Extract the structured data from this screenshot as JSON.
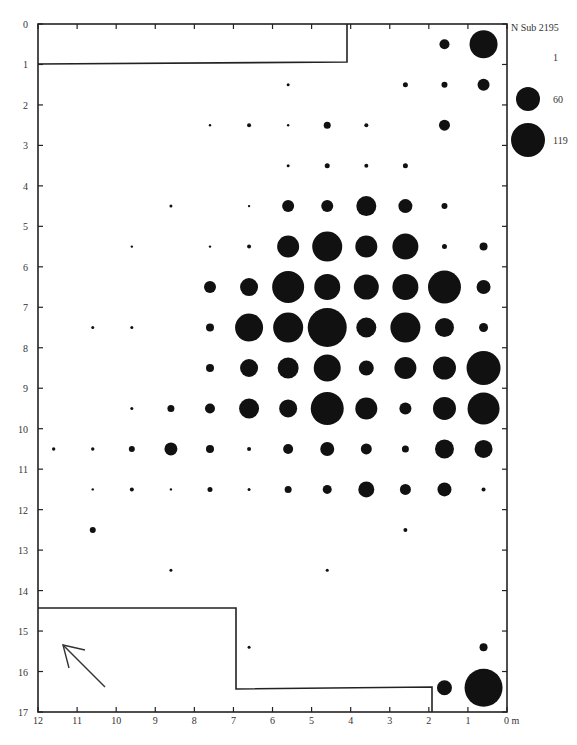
{
  "chart_data": {
    "type": "scatter",
    "subtype": "proportional-symbol grid map",
    "title": "",
    "xlabel": "m",
    "ylabel": "",
    "xlim": [
      12,
      0
    ],
    "ylim": [
      17,
      0
    ],
    "x_ticks": [
      "12",
      "11",
      "10",
      "9",
      "8",
      "7",
      "6",
      "5",
      "4",
      "3",
      "2",
      "1",
      "0 m"
    ],
    "y_ticks": [
      "0",
      "1",
      "2",
      "3",
      "4",
      "5",
      "6",
      "7",
      "8",
      "9",
      "10",
      "11",
      "12",
      "13",
      "14",
      "15",
      "16",
      "17"
    ],
    "grid": false,
    "legend": {
      "position": "top-right",
      "title": "N Sub",
      "total": "2195",
      "entries": [
        {
          "label": "1",
          "radius_px": 0
        },
        {
          "label": "60",
          "radius_px": 12
        },
        {
          "label": "119",
          "radius_px": 17
        }
      ]
    },
    "points_note": "x,y in metres; r = symbol radius in px (area proportional to count)",
    "points": [
      {
        "x": 1.6,
        "y": 0.5,
        "r": 5
      },
      {
        "x": 0.6,
        "y": 0.5,
        "r": 14
      },
      {
        "x": 5.6,
        "y": 1.5,
        "r": 1.5
      },
      {
        "x": 2.6,
        "y": 1.5,
        "r": 2.5
      },
      {
        "x": 1.6,
        "y": 1.5,
        "r": 3
      },
      {
        "x": 0.6,
        "y": 1.5,
        "r": 6
      },
      {
        "x": 7.6,
        "y": 2.5,
        "r": 1.2
      },
      {
        "x": 6.6,
        "y": 2.5,
        "r": 2
      },
      {
        "x": 5.6,
        "y": 2.5,
        "r": 1.2
      },
      {
        "x": 4.6,
        "y": 2.5,
        "r": 3.5
      },
      {
        "x": 3.6,
        "y": 2.5,
        "r": 2
      },
      {
        "x": 1.6,
        "y": 2.5,
        "r": 5.5
      },
      {
        "x": 5.6,
        "y": 3.5,
        "r": 1.5
      },
      {
        "x": 4.6,
        "y": 3.5,
        "r": 2.5
      },
      {
        "x": 3.6,
        "y": 3.5,
        "r": 2
      },
      {
        "x": 2.6,
        "y": 3.5,
        "r": 2.5
      },
      {
        "x": 8.6,
        "y": 4.5,
        "r": 1.5
      },
      {
        "x": 6.6,
        "y": 4.5,
        "r": 1.2
      },
      {
        "x": 5.6,
        "y": 4.5,
        "r": 6
      },
      {
        "x": 4.6,
        "y": 4.5,
        "r": 6
      },
      {
        "x": 3.6,
        "y": 4.5,
        "r": 10
      },
      {
        "x": 2.6,
        "y": 4.5,
        "r": 7
      },
      {
        "x": 1.6,
        "y": 4.5,
        "r": 3
      },
      {
        "x": 9.6,
        "y": 5.5,
        "r": 1.2
      },
      {
        "x": 7.6,
        "y": 5.5,
        "r": 1.2
      },
      {
        "x": 6.6,
        "y": 5.5,
        "r": 2
      },
      {
        "x": 5.6,
        "y": 5.5,
        "r": 11
      },
      {
        "x": 4.6,
        "y": 5.5,
        "r": 15
      },
      {
        "x": 3.6,
        "y": 5.5,
        "r": 11
      },
      {
        "x": 2.6,
        "y": 5.5,
        "r": 13
      },
      {
        "x": 1.6,
        "y": 5.5,
        "r": 2.5
      },
      {
        "x": 0.6,
        "y": 5.5,
        "r": 4
      },
      {
        "x": 7.6,
        "y": 6.5,
        "r": 6
      },
      {
        "x": 6.6,
        "y": 6.5,
        "r": 9
      },
      {
        "x": 5.6,
        "y": 6.5,
        "r": 16
      },
      {
        "x": 4.6,
        "y": 6.5,
        "r": 13
      },
      {
        "x": 3.6,
        "y": 6.5,
        "r": 12.5
      },
      {
        "x": 2.6,
        "y": 6.5,
        "r": 13
      },
      {
        "x": 1.6,
        "y": 6.5,
        "r": 16.5
      },
      {
        "x": 0.6,
        "y": 6.5,
        "r": 7
      },
      {
        "x": 10.6,
        "y": 7.5,
        "r": 1.5
      },
      {
        "x": 9.6,
        "y": 7.5,
        "r": 1.5
      },
      {
        "x": 7.6,
        "y": 7.5,
        "r": 4
      },
      {
        "x": 6.6,
        "y": 7.5,
        "r": 14
      },
      {
        "x": 5.6,
        "y": 7.5,
        "r": 15
      },
      {
        "x": 4.6,
        "y": 7.5,
        "r": 19.5
      },
      {
        "x": 3.6,
        "y": 7.5,
        "r": 10
      },
      {
        "x": 2.6,
        "y": 7.5,
        "r": 15
      },
      {
        "x": 1.6,
        "y": 7.5,
        "r": 9.5
      },
      {
        "x": 0.6,
        "y": 7.5,
        "r": 4.5
      },
      {
        "x": 7.6,
        "y": 8.5,
        "r": 4
      },
      {
        "x": 6.6,
        "y": 8.5,
        "r": 9
      },
      {
        "x": 5.6,
        "y": 8.5,
        "r": 10.5
      },
      {
        "x": 4.6,
        "y": 8.5,
        "r": 13.5
      },
      {
        "x": 3.6,
        "y": 8.5,
        "r": 7.5
      },
      {
        "x": 2.6,
        "y": 8.5,
        "r": 11
      },
      {
        "x": 1.6,
        "y": 8.5,
        "r": 11.5
      },
      {
        "x": 0.6,
        "y": 8.5,
        "r": 17
      },
      {
        "x": 9.6,
        "y": 9.5,
        "r": 1.5
      },
      {
        "x": 8.6,
        "y": 9.5,
        "r": 3.5
      },
      {
        "x": 7.6,
        "y": 9.5,
        "r": 5
      },
      {
        "x": 6.6,
        "y": 9.5,
        "r": 10
      },
      {
        "x": 5.6,
        "y": 9.5,
        "r": 9
      },
      {
        "x": 4.6,
        "y": 9.5,
        "r": 16.5
      },
      {
        "x": 3.6,
        "y": 9.5,
        "r": 11
      },
      {
        "x": 2.6,
        "y": 9.5,
        "r": 6
      },
      {
        "x": 1.6,
        "y": 9.5,
        "r": 11.5
      },
      {
        "x": 0.6,
        "y": 9.5,
        "r": 16
      },
      {
        "x": 11.6,
        "y": 10.5,
        "r": 1.7
      },
      {
        "x": 10.6,
        "y": 10.5,
        "r": 1.7
      },
      {
        "x": 9.6,
        "y": 10.5,
        "r": 3
      },
      {
        "x": 8.6,
        "y": 10.5,
        "r": 6.5
      },
      {
        "x": 7.6,
        "y": 10.5,
        "r": 4
      },
      {
        "x": 6.6,
        "y": 10.5,
        "r": 2
      },
      {
        "x": 5.6,
        "y": 10.5,
        "r": 5
      },
      {
        "x": 4.6,
        "y": 10.5,
        "r": 7
      },
      {
        "x": 3.6,
        "y": 10.5,
        "r": 5.5
      },
      {
        "x": 2.6,
        "y": 10.5,
        "r": 3.5
      },
      {
        "x": 1.6,
        "y": 10.5,
        "r": 9.5
      },
      {
        "x": 0.6,
        "y": 10.5,
        "r": 9
      },
      {
        "x": 10.6,
        "y": 11.5,
        "r": 1.2
      },
      {
        "x": 9.6,
        "y": 11.5,
        "r": 2
      },
      {
        "x": 8.6,
        "y": 11.5,
        "r": 1.2
      },
      {
        "x": 7.6,
        "y": 11.5,
        "r": 2.5
      },
      {
        "x": 6.6,
        "y": 11.5,
        "r": 1.5
      },
      {
        "x": 5.6,
        "y": 11.5,
        "r": 3.5
      },
      {
        "x": 4.6,
        "y": 11.5,
        "r": 4.5
      },
      {
        "x": 3.6,
        "y": 11.5,
        "r": 8
      },
      {
        "x": 2.6,
        "y": 11.5,
        "r": 5.5
      },
      {
        "x": 1.6,
        "y": 11.5,
        "r": 7
      },
      {
        "x": 0.6,
        "y": 11.5,
        "r": 2
      },
      {
        "x": 10.6,
        "y": 12.5,
        "r": 3
      },
      {
        "x": 2.6,
        "y": 12.5,
        "r": 2
      },
      {
        "x": 8.6,
        "y": 13.5,
        "r": 1.5
      },
      {
        "x": 4.6,
        "y": 13.5,
        "r": 1.5
      },
      {
        "x": 6.6,
        "y": 15.4,
        "r": 1.5
      },
      {
        "x": 0.6,
        "y": 15.4,
        "r": 4
      },
      {
        "x": 1.6,
        "y": 16.4,
        "r": 7.5
      },
      {
        "x": 0.6,
        "y": 16.4,
        "r": 19
      }
    ],
    "annotations": [
      "north arrow (lower left)",
      "wall outline top-left 12–4.2 m × 0–1 m",
      "wall outline bottom 12–7 m × 14.5–17 m and 7–2 m × 16.5–17 m"
    ]
  }
}
